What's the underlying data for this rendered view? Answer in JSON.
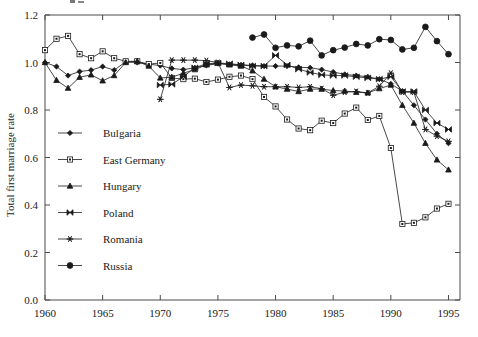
{
  "chart_data": {
    "type": "line",
    "title": "",
    "xlabel": "",
    "ylabel": "Total first marriage rate",
    "xlim": [
      1960,
      1996
    ],
    "ylim": [
      0.0,
      1.2
    ],
    "xticks": [
      1960,
      1965,
      1970,
      1975,
      1980,
      1985,
      1990,
      1995
    ],
    "yticks": [
      "0.0",
      "0.2",
      "0.4",
      "0.6",
      "0.8",
      "1.0",
      "1.2"
    ],
    "ytick_values": [
      0.0,
      0.2,
      0.4,
      0.6,
      0.8,
      1.0,
      1.2
    ],
    "grid": false,
    "legend_position": "inside-left",
    "series": [
      {
        "name": "Bulgaria",
        "marker": "diamond",
        "x": [
          1960,
          1961,
          1962,
          1963,
          1964,
          1965,
          1966,
          1967,
          1968,
          1969,
          1970,
          1971,
          1972,
          1973,
          1974,
          1975,
          1976,
          1977,
          1978,
          1979,
          1980,
          1981,
          1982,
          1983,
          1984,
          1985,
          1986,
          1987,
          1988,
          1989,
          1990,
          1991,
          1992,
          1993,
          1994,
          1995
        ],
        "y": [
          1.0,
          0.983,
          0.945,
          0.962,
          0.968,
          0.983,
          0.968,
          1.003,
          1.0,
          0.993,
          0.987,
          0.975,
          0.97,
          0.978,
          0.988,
          0.995,
          0.992,
          0.99,
          0.988,
          0.985,
          0.985,
          0.985,
          0.98,
          0.978,
          0.97,
          0.96,
          0.95,
          0.945,
          0.94,
          0.93,
          0.91,
          0.88,
          0.82,
          0.76,
          0.7,
          0.66
        ]
      },
      {
        "name": "East Germany",
        "marker": "open-square",
        "x": [
          1960,
          1961,
          1962,
          1963,
          1964,
          1965,
          1966,
          1967,
          1968,
          1969,
          1970,
          1971,
          1972,
          1973,
          1974,
          1975,
          1976,
          1977,
          1978,
          1979,
          1980,
          1981,
          1982,
          1983,
          1984,
          1985,
          1986,
          1987,
          1988,
          1989,
          1990,
          1991,
          1992,
          1993,
          1994,
          1995
        ],
        "y": [
          1.052,
          1.1,
          1.112,
          1.035,
          1.018,
          1.047,
          1.018,
          1.005,
          1.005,
          0.993,
          0.998,
          0.935,
          0.93,
          0.932,
          0.918,
          0.928,
          0.94,
          0.945,
          0.93,
          0.855,
          0.815,
          0.76,
          0.722,
          0.715,
          0.755,
          0.745,
          0.785,
          0.81,
          0.758,
          0.775,
          0.64,
          0.32,
          0.325,
          0.348,
          0.385,
          0.405
        ]
      },
      {
        "name": "Hungary",
        "marker": "triangle",
        "x": [
          1960,
          1961,
          1962,
          1963,
          1964,
          1965,
          1966,
          1967,
          1968,
          1969,
          1970,
          1971,
          1972,
          1973,
          1974,
          1975,
          1976,
          1977,
          1978,
          1979,
          1980,
          1981,
          1982,
          1983,
          1984,
          1985,
          1986,
          1987,
          1988,
          1989,
          1990,
          1991,
          1992,
          1993,
          1994,
          1995
        ],
        "y": [
          1.0,
          0.925,
          0.892,
          0.938,
          0.948,
          0.923,
          0.945,
          1.0,
          1.005,
          0.985,
          0.935,
          0.938,
          0.955,
          0.97,
          0.99,
          0.998,
          0.99,
          0.985,
          0.965,
          0.93,
          0.898,
          0.888,
          0.878,
          0.888,
          0.888,
          0.882,
          0.88,
          0.875,
          0.872,
          0.89,
          0.905,
          0.82,
          0.745,
          0.66,
          0.59,
          0.548
        ]
      },
      {
        "name": "Poland",
        "marker": "bowtie",
        "x": [
          1970,
          1971,
          1972,
          1973,
          1974,
          1975,
          1976,
          1977,
          1978,
          1979,
          1980,
          1981,
          1982,
          1983,
          1984,
          1985,
          1986,
          1987,
          1988,
          1989,
          1990,
          1991,
          1992,
          1993,
          1994,
          1995
        ],
        "y": [
          0.905,
          0.908,
          0.94,
          0.978,
          0.995,
          0.998,
          0.995,
          0.99,
          0.985,
          0.985,
          1.03,
          0.99,
          0.972,
          0.958,
          0.948,
          0.945,
          0.945,
          0.94,
          0.935,
          0.93,
          0.94,
          0.878,
          0.878,
          0.8,
          0.745,
          0.718
        ]
      },
      {
        "name": "Romania",
        "marker": "asterisk",
        "x": [
          1970,
          1971,
          1972,
          1973,
          1974,
          1975,
          1976,
          1977,
          1978,
          1979,
          1980,
          1981,
          1982,
          1983,
          1984,
          1985,
          1986,
          1987,
          1988,
          1989,
          1990,
          1991,
          1992,
          1993,
          1994,
          1995
        ],
        "y": [
          0.845,
          1.01,
          1.01,
          1.01,
          1.008,
          1.0,
          0.895,
          0.905,
          0.902,
          0.898,
          0.898,
          0.898,
          0.895,
          0.898,
          0.89,
          0.862,
          0.875,
          0.878,
          0.872,
          0.9,
          0.955,
          0.875,
          0.875,
          0.718,
          0.69,
          0.668
        ]
      },
      {
        "name": "Russia",
        "marker": "filled-circle",
        "x": [
          1978,
          1979,
          1980,
          1981,
          1982,
          1983,
          1984,
          1985,
          1986,
          1987,
          1988,
          1989,
          1990,
          1991,
          1992,
          1993,
          1994,
          1995
        ],
        "y": [
          1.105,
          1.118,
          1.062,
          1.072,
          1.068,
          1.092,
          1.03,
          1.052,
          1.063,
          1.078,
          1.072,
          1.098,
          1.095,
          1.055,
          1.062,
          1.15,
          1.09,
          1.035
        ]
      }
    ]
  },
  "legend": {
    "items": [
      {
        "label": "Bulgaria"
      },
      {
        "label": "East Germany"
      },
      {
        "label": "Hungary"
      },
      {
        "label": "Poland"
      },
      {
        "label": "Romania"
      },
      {
        "label": "Russia"
      }
    ]
  }
}
